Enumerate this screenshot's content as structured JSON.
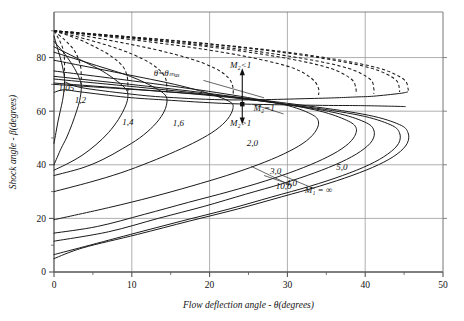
{
  "chart_data": {
    "type": "line",
    "title": "",
    "xlabel": "Flow deflection angle - θ(degrees)",
    "ylabel": "Shock angle - β(degrees)",
    "xlim": [
      0,
      50
    ],
    "ylim": [
      0,
      97
    ],
    "xticks": [
      0,
      10,
      20,
      30,
      40,
      50
    ],
    "xtick_labels": [
      "0",
      "10",
      "20",
      "30",
      "40",
      "50"
    ],
    "xminor_step": 5,
    "yticks": [
      0,
      20,
      40,
      60,
      80
    ],
    "ytick_labels": [
      "0",
      "20",
      "40",
      "60",
      "80"
    ],
    "yminor_step": 10,
    "grid": true,
    "legend": "none",
    "series": [
      {
        "name": "1,05",
        "mach": 1.05,
        "label": "1,05",
        "label_x": 1.6,
        "label_y": 67.5,
        "theta_max": 1.35,
        "beta_at_theta_max": 74.0,
        "points": [
          [
            0,
            88.0
          ],
          [
            0.4,
            84.0
          ],
          [
            0.8,
            80.0
          ],
          [
            1.1,
            76.5
          ],
          [
            1.3,
            73.5
          ],
          [
            1.35,
            71.0
          ],
          [
            1.3,
            68.0
          ],
          [
            1.1,
            64.0
          ],
          [
            0.8,
            60.0
          ],
          [
            0.5,
            56.0
          ],
          [
            0.25,
            52.0
          ],
          [
            0.0,
            48.0
          ]
        ]
      },
      {
        "name": "1,2",
        "mach": 1.2,
        "label": "1,2",
        "label_x": 3.4,
        "label_y": 63.0,
        "theta_max": 3.5,
        "beta_at_theta_max": 70.0,
        "points": [
          [
            0,
            86.0
          ],
          [
            1.2,
            82.0
          ],
          [
            2.2,
            78.0
          ],
          [
            3.0,
            74.0
          ],
          [
            3.45,
            70.5
          ],
          [
            3.5,
            68.0
          ],
          [
            3.3,
            64.0
          ],
          [
            2.9,
            60.0
          ],
          [
            2.3,
            55.0
          ],
          [
            1.6,
            50.0
          ],
          [
            0.9,
            46.0
          ],
          [
            0.0,
            40.0
          ]
        ]
      },
      {
        "name": "1,4",
        "mach": 1.4,
        "label": "1,4",
        "label_x": 9.5,
        "label_y": 55.0,
        "theta_max": 9.5,
        "beta_at_theta_max": 67.0,
        "points": [
          [
            0,
            84.0
          ],
          [
            3.5,
            79.0
          ],
          [
            6.2,
            75.0
          ],
          [
            8.2,
            71.0
          ],
          [
            9.3,
            68.0
          ],
          [
            9.5,
            65.5
          ],
          [
            9.2,
            62.0
          ],
          [
            8.3,
            57.0
          ],
          [
            7.0,
            52.0
          ],
          [
            5.4,
            47.5
          ],
          [
            3.6,
            43.5
          ],
          [
            1.8,
            40.5
          ],
          [
            0.0,
            38.0
          ]
        ]
      },
      {
        "name": "1,6",
        "mach": 1.6,
        "label": "1,6",
        "label_x": 16.0,
        "label_y": 54.5,
        "theta_max": 14.5,
        "beta_at_theta_max": 65.0,
        "points": [
          [
            0,
            82.0
          ],
          [
            5.5,
            77.0
          ],
          [
            9.8,
            73.0
          ],
          [
            12.8,
            69.0
          ],
          [
            14.3,
            66.0
          ],
          [
            14.5,
            63.0
          ],
          [
            14.0,
            59.0
          ],
          [
            12.8,
            54.5
          ],
          [
            11.0,
            50.0
          ],
          [
            8.8,
            46.0
          ],
          [
            6.3,
            42.0
          ],
          [
            3.6,
            38.8
          ],
          [
            0.0,
            36.0
          ]
        ]
      },
      {
        "name": "2,0",
        "mach": 2.0,
        "label": "2,0",
        "label_x": 25.5,
        "label_y": 47.0,
        "theta_max": 23.0,
        "beta_at_theta_max": 64.5,
        "points": [
          [
            0,
            79.0
          ],
          [
            8.8,
            74.0
          ],
          [
            15.5,
            70.0
          ],
          [
            20.0,
            66.5
          ],
          [
            22.6,
            63.5
          ],
          [
            23.0,
            61.0
          ],
          [
            22.3,
            57.0
          ],
          [
            20.8,
            53.0
          ],
          [
            18.5,
            49.0
          ],
          [
            15.6,
            45.0
          ],
          [
            12.3,
            41.0
          ],
          [
            8.6,
            37.0
          ],
          [
            4.6,
            33.5
          ],
          [
            0.0,
            30.0
          ]
        ]
      },
      {
        "name": "3,0",
        "mach": 3.0,
        "label": "3,0",
        "label_x": 28.5,
        "label_y": 36.5,
        "theta_max": 34.0,
        "beta_at_theta_max": 65.0,
        "points": [
          [
            0,
            75.0
          ],
          [
            13.5,
            70.0
          ],
          [
            23.0,
            66.0
          ],
          [
            29.5,
            62.5
          ],
          [
            33.0,
            59.0
          ],
          [
            34.0,
            56.0
          ],
          [
            33.5,
            52.0
          ],
          [
            32.0,
            48.0
          ],
          [
            29.5,
            44.0
          ],
          [
            26.2,
            40.0
          ],
          [
            22.2,
            36.0
          ],
          [
            17.6,
            32.0
          ],
          [
            12.6,
            28.0
          ],
          [
            7.0,
            24.0
          ],
          [
            0.0,
            19.5
          ]
        ]
      },
      {
        "name": "4,0",
        "mach": 4.0,
        "label": "4,0",
        "label_x": 30.5,
        "label_y": 32.0,
        "theta_max": 38.8,
        "beta_at_theta_max": 65.5,
        "points": [
          [
            0,
            73.0
          ],
          [
            16.0,
            68.0
          ],
          [
            26.5,
            64.0
          ],
          [
            33.5,
            60.5
          ],
          [
            37.3,
            57.0
          ],
          [
            38.8,
            54.0
          ],
          [
            38.5,
            50.0
          ],
          [
            37.0,
            46.0
          ],
          [
            34.5,
            42.0
          ],
          [
            31.2,
            38.0
          ],
          [
            27.2,
            34.0
          ],
          [
            22.5,
            30.0
          ],
          [
            17.3,
            26.0
          ],
          [
            11.6,
            21.5
          ],
          [
            5.6,
            17.0
          ],
          [
            0.0,
            14.5
          ]
        ]
      },
      {
        "name": "5,0",
        "mach": 5.0,
        "label": "5,0",
        "label_x": 37.0,
        "label_y": 38.0,
        "theta_max": 41.1,
        "beta_at_theta_max": 66.0,
        "points": [
          [
            0,
            72.0
          ],
          [
            17.5,
            67.0
          ],
          [
            28.6,
            63.0
          ],
          [
            36.0,
            59.5
          ],
          [
            39.9,
            56.0
          ],
          [
            41.1,
            53.0
          ],
          [
            40.9,
            49.0
          ],
          [
            39.4,
            45.0
          ],
          [
            36.9,
            41.0
          ],
          [
            33.5,
            37.0
          ],
          [
            29.4,
            33.0
          ],
          [
            24.6,
            29.0
          ],
          [
            19.3,
            24.5
          ],
          [
            13.4,
            20.0
          ],
          [
            7.0,
            15.0
          ],
          [
            0.0,
            11.5
          ]
        ]
      },
      {
        "name": "10,0",
        "mach": 10.0,
        "label": "10,0",
        "label_x": 29.5,
        "label_y": 31.0,
        "theta_max": 44.4,
        "beta_at_theta_max": 67.0,
        "points": [
          [
            0,
            70.5
          ],
          [
            19.5,
            66.0
          ],
          [
            31.4,
            62.0
          ],
          [
            39.2,
            58.5
          ],
          [
            43.2,
            55.0
          ],
          [
            44.4,
            52.0
          ],
          [
            44.3,
            48.0
          ],
          [
            42.9,
            44.0
          ],
          [
            40.5,
            40.0
          ],
          [
            37.1,
            36.0
          ],
          [
            32.9,
            32.0
          ],
          [
            28.0,
            28.0
          ],
          [
            22.5,
            23.5
          ],
          [
            16.4,
            19.0
          ],
          [
            9.8,
            14.0
          ],
          [
            3.3,
            9.0
          ],
          [
            0.0,
            6.5
          ]
        ]
      },
      {
        "name": "M1=inf",
        "mach": null,
        "label": "M₁ = ∞",
        "label_x": 34.0,
        "label_y": 29.5,
        "theta_max": 45.5,
        "beta_at_theta_max": 67.5,
        "points": [
          [
            0,
            70.0
          ],
          [
            20.3,
            66.0
          ],
          [
            32.5,
            62.0
          ],
          [
            40.4,
            58.5
          ],
          [
            44.4,
            55.0
          ],
          [
            45.5,
            52.0
          ],
          [
            45.4,
            48.0
          ],
          [
            44.1,
            44.0
          ],
          [
            41.7,
            40.0
          ],
          [
            38.3,
            36.0
          ],
          [
            34.1,
            32.0
          ],
          [
            29.2,
            28.0
          ],
          [
            23.6,
            23.5
          ],
          [
            17.4,
            19.0
          ],
          [
            10.7,
            14.0
          ],
          [
            3.7,
            9.0
          ],
          [
            0.0,
            5.0
          ]
        ]
      }
    ],
    "sonic_line": {
      "name": "M2=1",
      "label": "M₂=1",
      "points": [
        [
          0,
          67.0
        ],
        [
          1.3,
          68.0
        ],
        [
          3.4,
          67.2
        ],
        [
          9.3,
          65.2
        ],
        [
          14.2,
          64.2
        ],
        [
          22.7,
          62.8
        ],
        [
          33.6,
          62.2
        ],
        [
          38.4,
          62.1
        ],
        [
          40.8,
          62.0
        ],
        [
          44.1,
          61.8
        ],
        [
          45.2,
          61.7
        ]
      ]
    },
    "theta_max_locus": {
      "name": "theta=theta_max",
      "label": "θ=θₘₐₓ",
      "label_x": 14.5,
      "label_y": 73.0,
      "points": [
        [
          1.35,
          71.0
        ],
        [
          3.5,
          68.8
        ],
        [
          9.5,
          66.5
        ],
        [
          14.5,
          65.2
        ],
        [
          23.0,
          64.2
        ],
        [
          34.0,
          64.8
        ],
        [
          38.8,
          65.3
        ],
        [
          41.1,
          65.6
        ],
        [
          44.4,
          66.6
        ],
        [
          45.5,
          67.2
        ]
      ]
    },
    "weak_dashed_branches": [
      {
        "name": "dashed-1,05",
        "points": [
          [
            0,
            90.0
          ],
          [
            0.6,
            87.0
          ],
          [
            1.0,
            84.5
          ],
          [
            1.25,
            82.0
          ],
          [
            1.35,
            79.0
          ],
          [
            1.35,
            75.5
          ],
          [
            1.35,
            72.0
          ]
        ]
      },
      {
        "name": "dashed-1,2",
        "points": [
          [
            0,
            90.0
          ],
          [
            1.4,
            86.5
          ],
          [
            2.4,
            83.5
          ],
          [
            3.0,
            80.5
          ],
          [
            3.4,
            77.0
          ],
          [
            3.5,
            73.5
          ],
          [
            3.5,
            70.0
          ]
        ]
      },
      {
        "name": "dashed-1,4",
        "points": [
          [
            0,
            90.0
          ],
          [
            3.0,
            87.0
          ],
          [
            5.6,
            83.5
          ],
          [
            7.6,
            80.0
          ],
          [
            8.9,
            76.5
          ],
          [
            9.4,
            73.0
          ],
          [
            9.5,
            69.5
          ],
          [
            9.5,
            67.0
          ]
        ]
      },
      {
        "name": "dashed-1,6",
        "points": [
          [
            0,
            90.0
          ],
          [
            4.6,
            86.5
          ],
          [
            8.5,
            83.0
          ],
          [
            11.4,
            79.5
          ],
          [
            13.3,
            76.0
          ],
          [
            14.3,
            72.5
          ],
          [
            14.5,
            69.0
          ],
          [
            14.5,
            66.0
          ]
        ]
      },
      {
        "name": "dashed-2,0",
        "points": [
          [
            0,
            90.0
          ],
          [
            7.0,
            86.5
          ],
          [
            13.0,
            83.0
          ],
          [
            17.6,
            79.5
          ],
          [
            20.7,
            76.0
          ],
          [
            22.4,
            72.5
          ],
          [
            23.0,
            69.0
          ],
          [
            23.0,
            65.5
          ]
        ]
      },
      {
        "name": "dashed-3,0",
        "points": [
          [
            0,
            90.0
          ],
          [
            10.5,
            86.5
          ],
          [
            19.5,
            83.0
          ],
          [
            26.2,
            79.5
          ],
          [
            30.8,
            76.0
          ],
          [
            33.2,
            72.0
          ],
          [
            34.0,
            68.5
          ],
          [
            34.0,
            66.0
          ]
        ]
      },
      {
        "name": "dashed-4,0",
        "points": [
          [
            0,
            90.0
          ],
          [
            12.3,
            86.5
          ],
          [
            22.6,
            83.0
          ],
          [
            30.3,
            79.5
          ],
          [
            35.5,
            76.0
          ],
          [
            38.2,
            72.0
          ],
          [
            38.8,
            68.5
          ],
          [
            38.8,
            66.3
          ]
        ]
      },
      {
        "name": "dashed-5,0",
        "points": [
          [
            0,
            90.0
          ],
          [
            13.2,
            86.5
          ],
          [
            24.2,
            83.0
          ],
          [
            32.3,
            79.5
          ],
          [
            37.8,
            76.0
          ],
          [
            40.6,
            72.0
          ],
          [
            41.1,
            68.5
          ],
          [
            41.1,
            66.5
          ]
        ]
      },
      {
        "name": "dashed-10,0",
        "points": [
          [
            0,
            90.0
          ],
          [
            14.5,
            86.5
          ],
          [
            26.4,
            83.0
          ],
          [
            35.0,
            79.5
          ],
          [
            40.8,
            76.0
          ],
          [
            43.8,
            72.0
          ],
          [
            44.4,
            68.5
          ],
          [
            44.4,
            67.2
          ]
        ]
      },
      {
        "name": "dashed-inf",
        "points": [
          [
            0,
            90.0
          ],
          [
            14.9,
            86.5
          ],
          [
            27.1,
            83.0
          ],
          [
            35.9,
            79.5
          ],
          [
            41.8,
            76.0
          ],
          [
            44.9,
            72.0
          ],
          [
            45.5,
            68.5
          ],
          [
            45.5,
            67.5
          ]
        ]
      }
    ],
    "annotations": [
      {
        "name": "m2-less-than-1",
        "text": "M₂<1",
        "x": 24.0,
        "y": 76.0
      },
      {
        "name": "m2-equal-1",
        "text": "M₂=1",
        "x": 27.0,
        "y": 60.0
      },
      {
        "name": "m2-greater-than-1",
        "text": "M₂>1",
        "x": 24.0,
        "y": 54.5
      },
      {
        "name": "theta-max",
        "text": "θ=θₘₐₓ",
        "x": 14.5,
        "y": 73.0
      }
    ],
    "sonic_marker": {
      "name": "sonic-point-marker",
      "x": 24.2,
      "y": 62.6
    },
    "colors": {
      "curve": "#1a1a1a",
      "grid": "#9a9a9a",
      "axis": "#4a4a4a",
      "text": "#111111",
      "background": "#ffffff"
    }
  }
}
